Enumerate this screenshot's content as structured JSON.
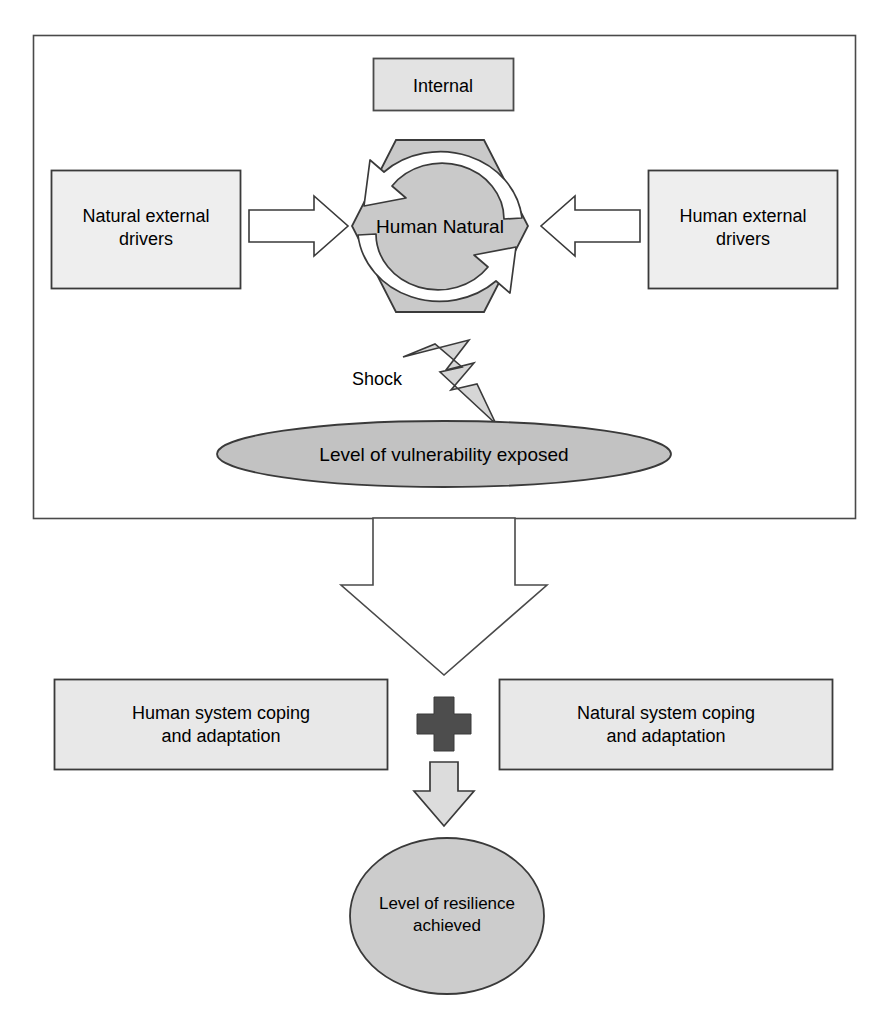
{
  "diagram": {
    "colors": {
      "box_fill": "#e3e3e3",
      "box_fill_light": "#eeeeee",
      "hexagon_fill": "#c9c9c9",
      "ellipse_fill": "#c2c2c2",
      "circle_fill": "#cccccc",
      "arrow_fill_white": "#ffffff",
      "arrow_fill_gray": "#dcdcdc",
      "bolt_fill": "#d6d6d6",
      "plus_fill": "#4d4d4d",
      "stroke": "#3a3a3a",
      "text": "#000000"
    },
    "outer_frame": {
      "name": "system-boundary-frame"
    },
    "nodes": {
      "internal": {
        "label": "Internal",
        "shape": "rectangle"
      },
      "natural_external_drivers": {
        "label": "Natural external\ndrivers",
        "shape": "rectangle"
      },
      "human_external_drivers": {
        "label": "Human external\ndrivers",
        "shape": "rectangle"
      },
      "human_natural": {
        "label": "Human Natural",
        "shape": "hexagon"
      },
      "shock": {
        "label": "Shock",
        "shape": "lightning-bolt"
      },
      "vulnerability": {
        "label": "Level of vulnerability exposed",
        "shape": "ellipse"
      },
      "human_coping": {
        "label": "Human system coping\nand adaptation",
        "shape": "rectangle"
      },
      "natural_coping": {
        "label": "Natural system coping\nand adaptation",
        "shape": "rectangle"
      },
      "plus": {
        "label": "+",
        "shape": "cross"
      },
      "resilience": {
        "label": "Level of resilience\nachieved",
        "shape": "ellipse"
      }
    },
    "connectors": {
      "natural_drivers_to_core": "arrow-right",
      "human_drivers_to_core": "arrow-left",
      "cycle_top": "curved-arrow-counterclockwise",
      "cycle_bottom": "curved-arrow-counterclockwise",
      "system_to_coping": "large-arrow-down",
      "coping_to_resilience": "arrow-down"
    }
  }
}
